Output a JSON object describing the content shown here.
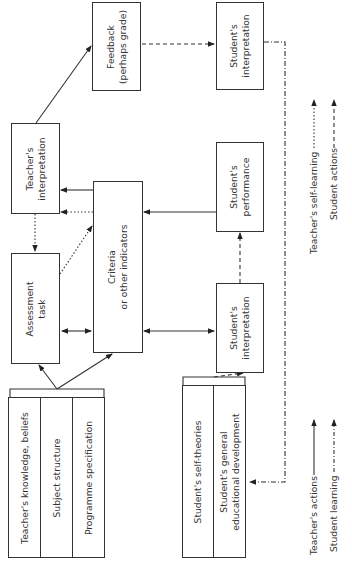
{
  "diagram": {
    "boxes": {
      "feedback": {
        "line1": "Feedback",
        "line2": "(perhaps grade)"
      },
      "student_interpretation_top": {
        "line1": "Student's",
        "line2": "interpretation"
      },
      "teacher_interpretation": {
        "line1": "Teacher's",
        "line2": "interpretation"
      },
      "student_performance": {
        "line1": "Student's",
        "line2": "performance"
      },
      "criteria": {
        "line1": "Criteria",
        "line2": "or other indicators"
      },
      "assessment_task": {
        "line1": "Assessment",
        "line2": "task"
      },
      "student_interpretation_mid": {
        "line1": "Student's",
        "line2": "interpretation"
      }
    },
    "teacher_inputs": [
      {
        "label": "Teacher's knowledge, beliefs"
      },
      {
        "label": "Subject structure"
      },
      {
        "label": "Programme specification"
      }
    ],
    "student_inputs": [
      {
        "line1": "Student's self-theories",
        "line2": ""
      },
      {
        "line1": "Student's general",
        "line2": "educational development"
      }
    ],
    "legend": {
      "teacher_actions": "Teacher's actions",
      "student_learning": "Student learning",
      "teacher_self_learning": "Teacher's self-learning",
      "student_actions": "Student actions"
    }
  }
}
